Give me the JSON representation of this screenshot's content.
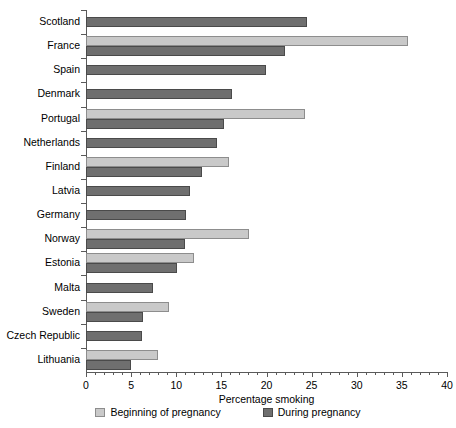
{
  "chart_data": {
    "type": "bar",
    "orientation": "horizontal",
    "title": "",
    "xlabel": "Percentage smoking",
    "ylabel": "",
    "xlim": [
      0,
      40
    ],
    "xticks": [
      0,
      5,
      10,
      15,
      20,
      25,
      30,
      35,
      40
    ],
    "xtick_labels": [
      "0",
      "5",
      "10",
      "15",
      "20",
      "25",
      "30",
      "35",
      "40"
    ],
    "grid": false,
    "legend_position": "bottom",
    "categories": [
      "Scotland",
      "France",
      "Spain",
      "Denmark",
      "Portugal",
      "Netherlands",
      "Finland",
      "Latvia",
      "Germany",
      "Norway",
      "Estonia",
      "Malta",
      "Sweden",
      "Czech Republic",
      "Lithuania"
    ],
    "series": [
      {
        "name": "Beginning of pregnancy",
        "color": "#c9c9c9",
        "values": [
          null,
          35.7,
          null,
          null,
          24.3,
          null,
          15.9,
          null,
          null,
          18.1,
          12.0,
          null,
          9.2,
          null,
          8.0
        ]
      },
      {
        "name": "During pregnancy",
        "color": "#6f6f6f",
        "values": [
          24.5,
          22.0,
          19.9,
          16.2,
          15.3,
          14.5,
          12.8,
          11.5,
          11.1,
          11.0,
          10.1,
          7.4,
          6.3,
          6.2,
          5.0
        ]
      }
    ]
  },
  "legend": {
    "items": [
      {
        "label": "Beginning of pregnancy",
        "key": "begin"
      },
      {
        "label": "During pregnancy",
        "key": "during"
      }
    ]
  },
  "axis": {
    "x_title": "Percentage smoking"
  }
}
